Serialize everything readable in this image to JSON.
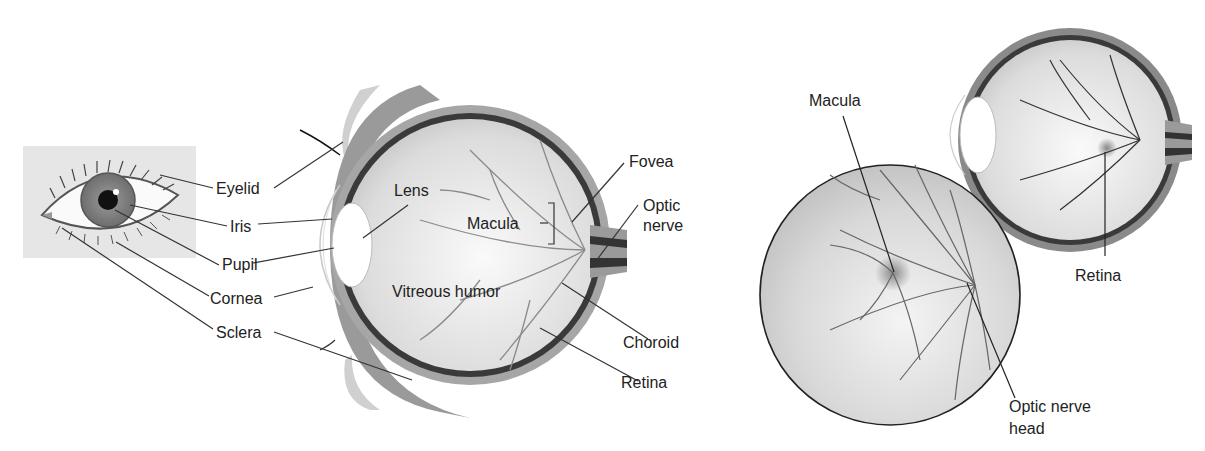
{
  "figure": {
    "left_panel": {
      "external_eye_labels": {
        "eyelid": "Eyelid",
        "iris": "Iris",
        "pupil": "Pupil",
        "cornea": "Cornea",
        "sclera": "Sclera"
      },
      "cross_section_labels": {
        "lens": "Lens",
        "macula": "Macula",
        "vitreous_humor": "Vitreous humor",
        "fovea": "Fovea",
        "optic_nerve_line1": "Optic",
        "optic_nerve_line2": "nerve",
        "choroid": "Choroid",
        "retina": "Retina"
      }
    },
    "right_panel": {
      "labels": {
        "macula": "Macula",
        "retina": "Retina",
        "optic_nerve_head_line1": "Optic nerve",
        "optic_nerve_head_line2": "head"
      }
    }
  }
}
